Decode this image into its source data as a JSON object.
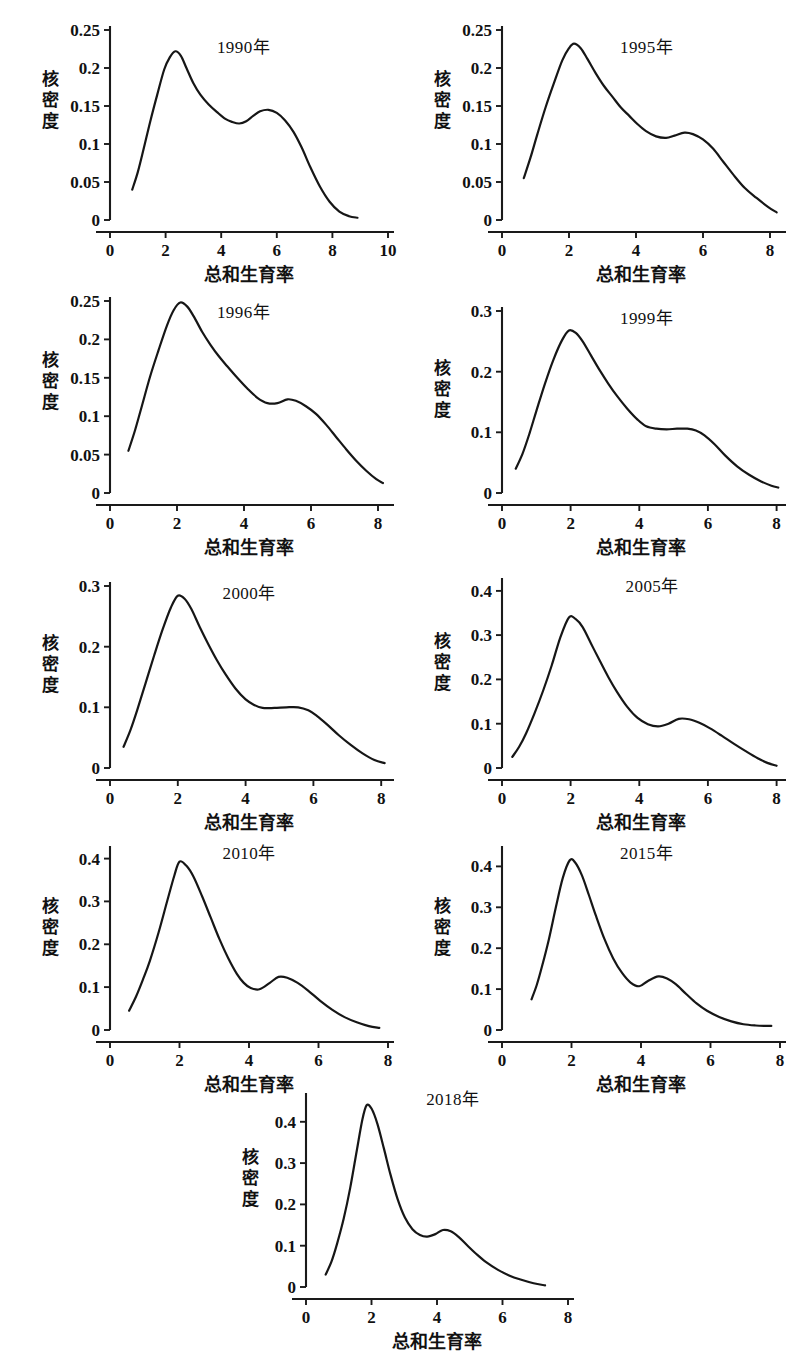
{
  "figure": {
    "background": "#ffffff",
    "curve_color": "#161616",
    "axis_color": "#1a1a1a",
    "y_axis_label": "核密度",
    "y_axis_label_chars": [
      "核",
      "密",
      "度"
    ],
    "x_axis_label": "总和生育率",
    "panel_count": 9,
    "layout": "3 rows of 2 panels plus 1 centered bottom panel"
  },
  "chart_data": [
    {
      "type": "line",
      "title": "1990年",
      "xlabel": "总和生育率",
      "ylabel": "核密度",
      "xlim": [
        0,
        10
      ],
      "ylim": [
        0,
        0.25
      ],
      "xticks": [
        0,
        2,
        4,
        6,
        8,
        10
      ],
      "xtick_labels": [
        "0",
        "2",
        "4",
        "6",
        "8",
        "10"
      ],
      "yticks": [
        0,
        0.05,
        0.1,
        0.15,
        0.2,
        0.25
      ],
      "ytick_labels": [
        "0",
        "0.05",
        "0.1",
        "0.15",
        "0.2",
        "0.25"
      ],
      "grid": false,
      "legend": "none",
      "x": [
        0.8,
        1.0,
        1.2,
        1.45,
        1.7,
        1.95,
        2.15,
        2.35,
        2.55,
        2.75,
        3.0,
        3.25,
        3.55,
        3.85,
        4.15,
        4.4,
        4.65,
        4.9,
        5.15,
        5.4,
        5.7,
        6.0,
        6.3,
        6.6,
        6.9,
        7.2,
        7.55,
        7.9,
        8.25,
        8.6,
        8.9
      ],
      "y": [
        0.04,
        0.063,
        0.092,
        0.13,
        0.165,
        0.198,
        0.214,
        0.222,
        0.216,
        0.2,
        0.18,
        0.165,
        0.152,
        0.142,
        0.133,
        0.129,
        0.127,
        0.13,
        0.137,
        0.143,
        0.145,
        0.141,
        0.131,
        0.116,
        0.095,
        0.07,
        0.044,
        0.024,
        0.011,
        0.005,
        0.003
      ]
    },
    {
      "type": "line",
      "title": "1995年",
      "xlabel": "总和生育率",
      "ylabel": "核密度",
      "xlim": [
        0,
        8.3
      ],
      "ylim": [
        0,
        0.25
      ],
      "xticks": [
        0,
        2,
        4,
        6,
        8
      ],
      "xtick_labels": [
        "0",
        "2",
        "4",
        "6",
        "8"
      ],
      "yticks": [
        0,
        0.05,
        0.1,
        0.15,
        0.2,
        0.25
      ],
      "ytick_labels": [
        "0",
        "0.05",
        "0.1",
        "0.15",
        "0.2",
        "0.25"
      ],
      "grid": false,
      "legend": "none",
      "x": [
        0.65,
        0.85,
        1.05,
        1.3,
        1.55,
        1.8,
        2.0,
        2.15,
        2.35,
        2.55,
        2.8,
        3.05,
        3.3,
        3.55,
        3.8,
        4.05,
        4.3,
        4.6,
        4.9,
        5.15,
        5.45,
        5.7,
        6.0,
        6.3,
        6.6,
        6.9,
        7.25,
        7.6,
        7.95,
        8.2
      ],
      "y": [
        0.055,
        0.082,
        0.112,
        0.148,
        0.18,
        0.21,
        0.226,
        0.232,
        0.226,
        0.212,
        0.193,
        0.176,
        0.162,
        0.148,
        0.137,
        0.126,
        0.117,
        0.11,
        0.108,
        0.111,
        0.115,
        0.113,
        0.106,
        0.094,
        0.077,
        0.06,
        0.042,
        0.029,
        0.017,
        0.01
      ]
    },
    {
      "type": "line",
      "title": "1996年",
      "xlabel": "总和生育率",
      "ylabel": "核密度",
      "xlim": [
        0,
        8.3
      ],
      "ylim": [
        0,
        0.25
      ],
      "xticks": [
        0,
        2,
        4,
        6,
        8
      ],
      "xtick_labels": [
        "0",
        "2",
        "4",
        "6",
        "8"
      ],
      "yticks": [
        0,
        0.05,
        0.1,
        0.15,
        0.2,
        0.25
      ],
      "ytick_labels": [
        "0",
        "0.05",
        "0.1",
        "0.15",
        "0.2",
        "0.25"
      ],
      "grid": false,
      "legend": "none",
      "x": [
        0.55,
        0.75,
        0.95,
        1.2,
        1.45,
        1.7,
        1.9,
        2.1,
        2.3,
        2.5,
        2.75,
        3.0,
        3.25,
        3.5,
        3.8,
        4.1,
        4.4,
        4.7,
        5.0,
        5.3,
        5.55,
        5.85,
        6.15,
        6.45,
        6.75,
        7.05,
        7.35,
        7.65,
        7.95,
        8.15
      ],
      "y": [
        0.055,
        0.082,
        0.113,
        0.152,
        0.186,
        0.218,
        0.238,
        0.248,
        0.243,
        0.23,
        0.21,
        0.193,
        0.178,
        0.165,
        0.15,
        0.136,
        0.124,
        0.117,
        0.117,
        0.122,
        0.12,
        0.113,
        0.103,
        0.089,
        0.073,
        0.057,
        0.042,
        0.029,
        0.018,
        0.013
      ]
    },
    {
      "type": "line",
      "title": "1999年",
      "xlabel": "总和生育率",
      "ylabel": "核密度",
      "xlim": [
        0,
        8.1
      ],
      "ylim": [
        0,
        0.3
      ],
      "xticks": [
        0,
        2,
        4,
        6,
        8
      ],
      "xtick_labels": [
        "0",
        "2",
        "4",
        "6",
        "8"
      ],
      "yticks": [
        0,
        0.1,
        0.2,
        0.3
      ],
      "ytick_labels": [
        "0",
        "0.1",
        "0.2",
        "0.3"
      ],
      "grid": false,
      "legend": "none",
      "x": [
        0.4,
        0.6,
        0.8,
        1.0,
        1.25,
        1.5,
        1.75,
        1.95,
        2.15,
        2.35,
        2.6,
        2.85,
        3.1,
        3.35,
        3.65,
        3.95,
        4.2,
        4.5,
        4.8,
        5.1,
        5.4,
        5.65,
        5.9,
        6.2,
        6.5,
        6.85,
        7.2,
        7.55,
        7.85,
        8.05
      ],
      "y": [
        0.04,
        0.065,
        0.098,
        0.135,
        0.18,
        0.22,
        0.252,
        0.268,
        0.264,
        0.25,
        0.226,
        0.202,
        0.18,
        0.16,
        0.139,
        0.121,
        0.11,
        0.106,
        0.105,
        0.106,
        0.106,
        0.103,
        0.095,
        0.08,
        0.062,
        0.044,
        0.03,
        0.019,
        0.012,
        0.009
      ]
    },
    {
      "type": "line",
      "title": "2000年",
      "xlabel": "总和生育率",
      "ylabel": "核密度",
      "xlim": [
        0,
        8.2
      ],
      "ylim": [
        0,
        0.3
      ],
      "xticks": [
        0,
        2,
        4,
        6,
        8
      ],
      "xtick_labels": [
        "0",
        "2",
        "4",
        "6",
        "8"
      ],
      "yticks": [
        0,
        0.1,
        0.2,
        0.3
      ],
      "ytick_labels": [
        "0",
        "0.1",
        "0.2",
        "0.3"
      ],
      "grid": false,
      "legend": "none",
      "x": [
        0.4,
        0.6,
        0.8,
        1.05,
        1.3,
        1.55,
        1.8,
        2.0,
        2.2,
        2.4,
        2.65,
        2.9,
        3.15,
        3.4,
        3.7,
        4.0,
        4.25,
        4.5,
        4.85,
        5.2,
        5.55,
        5.85,
        6.1,
        6.4,
        6.75,
        7.1,
        7.45,
        7.8,
        8.1
      ],
      "y": [
        0.035,
        0.062,
        0.095,
        0.14,
        0.185,
        0.228,
        0.265,
        0.284,
        0.279,
        0.262,
        0.232,
        0.204,
        0.178,
        0.155,
        0.131,
        0.113,
        0.104,
        0.099,
        0.099,
        0.1,
        0.1,
        0.095,
        0.086,
        0.072,
        0.054,
        0.038,
        0.024,
        0.013,
        0.008
      ]
    },
    {
      "type": "line",
      "title": "2005年",
      "xlabel": "总和生育率",
      "ylabel": "核密度",
      "xlim": [
        0,
        8.1
      ],
      "ylim": [
        0,
        0.42
      ],
      "xticks": [
        0,
        2,
        4,
        6,
        8
      ],
      "xtick_labels": [
        "0",
        "2",
        "4",
        "6",
        "8"
      ],
      "yticks": [
        0,
        0.1,
        0.2,
        0.3,
        0.4
      ],
      "ytick_labels": [
        "0",
        "0.1",
        "0.2",
        "0.3",
        "0.4"
      ],
      "grid": false,
      "legend": "none",
      "x": [
        0.3,
        0.5,
        0.7,
        0.95,
        1.2,
        1.45,
        1.7,
        1.95,
        2.15,
        2.35,
        2.6,
        2.85,
        3.1,
        3.35,
        3.65,
        3.95,
        4.25,
        4.55,
        4.85,
        5.15,
        5.45,
        5.75,
        6.05,
        6.4,
        6.75,
        7.1,
        7.45,
        7.75,
        8.0
      ],
      "y": [
        0.025,
        0.048,
        0.078,
        0.124,
        0.175,
        0.232,
        0.295,
        0.34,
        0.336,
        0.318,
        0.28,
        0.242,
        0.205,
        0.172,
        0.138,
        0.113,
        0.099,
        0.094,
        0.1,
        0.111,
        0.11,
        0.102,
        0.09,
        0.073,
        0.055,
        0.038,
        0.022,
        0.011,
        0.005
      ]
    },
    {
      "type": "line",
      "title": "2010年",
      "xlabel": "总和生育率",
      "ylabel": "核密度",
      "xlim": [
        0,
        8.0
      ],
      "ylim": [
        0,
        0.42
      ],
      "xticks": [
        0,
        2,
        4,
        6,
        8
      ],
      "xtick_labels": [
        "0",
        "2",
        "4",
        "6",
        "8"
      ],
      "yticks": [
        0,
        0.1,
        0.2,
        0.3,
        0.4
      ],
      "ytick_labels": [
        "0",
        "0.1",
        "0.2",
        "0.3",
        "0.4"
      ],
      "grid": false,
      "legend": "none",
      "x": [
        0.55,
        0.75,
        0.95,
        1.15,
        1.4,
        1.65,
        1.85,
        2.0,
        2.2,
        2.4,
        2.65,
        2.9,
        3.15,
        3.4,
        3.65,
        3.85,
        4.05,
        4.3,
        4.6,
        4.85,
        5.1,
        5.4,
        5.7,
        6.05,
        6.4,
        6.75,
        7.1,
        7.45,
        7.75
      ],
      "y": [
        0.045,
        0.078,
        0.118,
        0.162,
        0.228,
        0.302,
        0.36,
        0.393,
        0.383,
        0.358,
        0.312,
        0.262,
        0.212,
        0.168,
        0.131,
        0.11,
        0.098,
        0.095,
        0.11,
        0.124,
        0.122,
        0.11,
        0.092,
        0.068,
        0.047,
        0.03,
        0.018,
        0.009,
        0.005
      ]
    },
    {
      "type": "line",
      "title": "2015年",
      "xlabel": "总和生育率",
      "ylabel": "核密度",
      "xlim": [
        0,
        8.0
      ],
      "ylim": [
        0,
        0.44
      ],
      "xticks": [
        0,
        2,
        4,
        6,
        8
      ],
      "xtick_labels": [
        "0",
        "2",
        "4",
        "6",
        "8"
      ],
      "yticks": [
        0,
        0.1,
        0.2,
        0.3,
        0.4
      ],
      "ytick_labels": [
        "0",
        "0.1",
        "0.2",
        "0.3",
        "0.4"
      ],
      "grid": false,
      "legend": "none",
      "x": [
        0.85,
        1.0,
        1.15,
        1.35,
        1.55,
        1.75,
        1.95,
        2.1,
        2.3,
        2.5,
        2.7,
        2.95,
        3.2,
        3.45,
        3.7,
        3.95,
        4.2,
        4.5,
        4.75,
        5.0,
        5.3,
        5.6,
        5.9,
        6.25,
        6.6,
        6.95,
        7.3,
        7.6,
        7.75
      ],
      "y": [
        0.075,
        0.11,
        0.155,
        0.222,
        0.3,
        0.372,
        0.415,
        0.41,
        0.378,
        0.33,
        0.28,
        0.222,
        0.175,
        0.14,
        0.116,
        0.107,
        0.12,
        0.131,
        0.126,
        0.112,
        0.088,
        0.065,
        0.047,
        0.032,
        0.021,
        0.014,
        0.011,
        0.01,
        0.01
      ]
    },
    {
      "type": "line",
      "title": "2018年",
      "xlabel": "总和生育率",
      "ylabel": "核密度",
      "xlim": [
        0,
        8.0
      ],
      "ylim": [
        0,
        0.46
      ],
      "xticks": [
        0,
        2,
        4,
        6,
        8
      ],
      "xtick_labels": [
        "0",
        "2",
        "4",
        "6",
        "8"
      ],
      "yticks": [
        0,
        0.1,
        0.2,
        0.3,
        0.4
      ],
      "ytick_labels": [
        "0",
        "0.1",
        "0.2",
        "0.3",
        "0.4"
      ],
      "grid": false,
      "legend": "none",
      "x": [
        0.6,
        0.78,
        0.95,
        1.15,
        1.35,
        1.55,
        1.72,
        1.85,
        2.0,
        2.18,
        2.38,
        2.58,
        2.8,
        3.02,
        3.25,
        3.48,
        3.7,
        3.95,
        4.18,
        4.42,
        4.65,
        4.92,
        5.2,
        5.5,
        5.85,
        6.2,
        6.55,
        6.95,
        7.3
      ],
      "y": [
        0.03,
        0.062,
        0.105,
        0.165,
        0.24,
        0.33,
        0.405,
        0.44,
        0.432,
        0.395,
        0.335,
        0.272,
        0.212,
        0.168,
        0.14,
        0.126,
        0.122,
        0.128,
        0.138,
        0.135,
        0.122,
        0.101,
        0.08,
        0.06,
        0.042,
        0.028,
        0.018,
        0.009,
        0.004
      ]
    }
  ]
}
